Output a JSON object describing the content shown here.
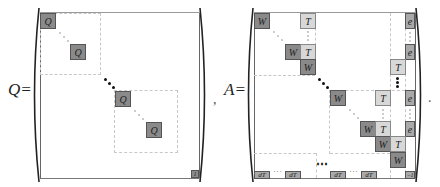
{
  "equations": {
    "q": {
      "label": "Q=",
      "trailing_punct": ",",
      "blocks": [
        {
          "id": "q1",
          "symbol": "Q"
        },
        {
          "id": "q2",
          "symbol": "Q"
        },
        {
          "id": "q3",
          "symbol": "Q"
        },
        {
          "id": "q4",
          "symbol": "Q"
        },
        {
          "id": "corner",
          "symbol": "1"
        }
      ]
    },
    "a": {
      "label": "A=",
      "trailing_punct": ".",
      "blocks": {
        "w": "W",
        "t": "T",
        "e": "e",
        "dt": "dT",
        "corner": "−1"
      },
      "bottom_row": [
        "dT",
        "⋯",
        "dT",
        "⋯",
        "dT",
        "⋯",
        "dT"
      ]
    }
  },
  "colors": {
    "dark_block": "#8a8a8a",
    "mid_block": "#a9a9a9",
    "light_block": "#d8d8d8",
    "dashed_guides": "#c8c8c8"
  }
}
